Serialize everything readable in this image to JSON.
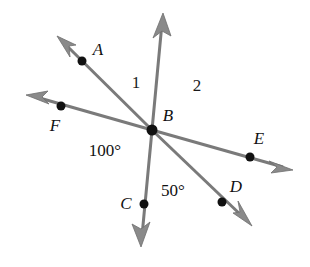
{
  "figure": {
    "background_color": "#ffffff",
    "line_color": "#7a7a7a",
    "arrow_color": "#8a8a8a",
    "dot_color": "#111111",
    "text_color": "#111111",
    "vertex": {
      "name": "B",
      "label": "B",
      "x": 152,
      "y": 130,
      "label_x": 168,
      "label_y": 117,
      "dot_radius": 5.5
    },
    "rays": [
      {
        "name": "ray-ba",
        "label": "A",
        "label_x": 98,
        "label_y": 51,
        "point_x": 82,
        "point_y": 61,
        "tip_x": 57,
        "tip_y": 36,
        "has_point_dot": true
      },
      {
        "name": "ray-b-up",
        "label": "",
        "label_x": null,
        "label_y": null,
        "point_x": null,
        "point_y": null,
        "tip_x": 163,
        "tip_y": 13,
        "has_point_dot": false
      },
      {
        "name": "ray-bf",
        "label": "F",
        "label_x": 55,
        "label_y": 127,
        "point_x": 61,
        "point_y": 106,
        "tip_x": 26,
        "tip_y": 95,
        "has_point_dot": true
      },
      {
        "name": "ray-be",
        "label": "E",
        "label_x": 259,
        "label_y": 140,
        "point_x": 250,
        "point_y": 157,
        "tip_x": 293,
        "tip_y": 170,
        "has_point_dot": true
      },
      {
        "name": "ray-bd",
        "label": "D",
        "label_x": 236,
        "label_y": 188,
        "point_x": 222,
        "point_y": 202,
        "tip_x": 252,
        "tip_y": 226,
        "has_point_dot": true
      },
      {
        "name": "ray-bc",
        "label": "C",
        "label_x": 126,
        "label_y": 205,
        "point_x": 144,
        "point_y": 204,
        "tip_x": 141,
        "tip_y": 247,
        "has_point_dot": true
      }
    ],
    "region_labels": [
      {
        "name": "angle-region-1",
        "text": "1",
        "x": 136,
        "y": 84
      },
      {
        "name": "angle-region-2",
        "text": "2",
        "x": 197,
        "y": 87
      }
    ],
    "angle_measures": [
      {
        "name": "angle-measure-100",
        "text": "100°",
        "x": 105,
        "y": 152
      },
      {
        "name": "angle-measure-50",
        "text": "50°",
        "x": 173,
        "y": 192
      }
    ]
  }
}
